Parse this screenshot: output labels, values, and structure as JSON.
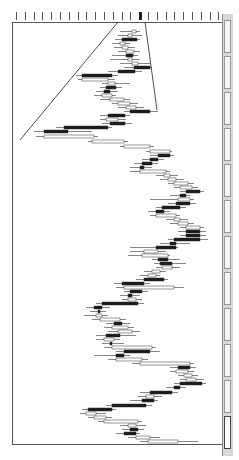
{
  "chart_data": {
    "type": "candlestick",
    "orientation": "rotated-90",
    "title": "",
    "xlabel": "price",
    "ylabel": "time",
    "grid": false,
    "legend": null,
    "price_axis_ticks": 24,
    "highlighted_tick_index": 14,
    "trendlines": [
      {
        "name": "trendline-1",
        "from": [
          118,
          22
        ],
        "to": [
          20,
          140
        ]
      },
      {
        "name": "trendline-2",
        "from": [
          145,
          22
        ],
        "to": [
          157,
          110
        ]
      }
    ],
    "candles_note": "approximate screen positions: y=row, o=open x, c=close x, l=low x, h=high x, bear=filled",
    "candles": [
      {
        "y": 30,
        "o": 132,
        "c": 136,
        "l": 120,
        "h": 140,
        "bear": false
      },
      {
        "y": 34,
        "o": 128,
        "c": 132,
        "l": 118,
        "h": 142,
        "bear": false
      },
      {
        "y": 38,
        "o": 122,
        "c": 137,
        "l": 115,
        "h": 140,
        "bear": true
      },
      {
        "y": 42,
        "o": 120,
        "c": 125,
        "l": 112,
        "h": 130,
        "bear": false
      },
      {
        "y": 46,
        "o": 122,
        "c": 128,
        "l": 114,
        "h": 135,
        "bear": false
      },
      {
        "y": 50,
        "o": 126,
        "c": 134,
        "l": 118,
        "h": 140,
        "bear": false
      },
      {
        "y": 54,
        "o": 126,
        "c": 133,
        "l": 112,
        "h": 138,
        "bear": true
      },
      {
        "y": 58,
        "o": 128,
        "c": 132,
        "l": 110,
        "h": 140,
        "bear": false
      },
      {
        "y": 62,
        "o": 132,
        "c": 138,
        "l": 120,
        "h": 150,
        "bear": false
      },
      {
        "y": 66,
        "o": 134,
        "c": 150,
        "l": 124,
        "h": 152,
        "bear": true
      },
      {
        "y": 70,
        "o": 118,
        "c": 135,
        "l": 108,
        "h": 142,
        "bear": true
      },
      {
        "y": 74,
        "o": 82,
        "c": 112,
        "l": 76,
        "h": 118,
        "bear": true
      },
      {
        "y": 78,
        "o": 82,
        "c": 108,
        "l": 78,
        "h": 115,
        "bear": false
      },
      {
        "y": 82,
        "o": 108,
        "c": 115,
        "l": 102,
        "h": 130,
        "bear": false
      },
      {
        "y": 86,
        "o": 106,
        "c": 116,
        "l": 100,
        "h": 122,
        "bear": true
      },
      {
        "y": 90,
        "o": 104,
        "c": 110,
        "l": 96,
        "h": 118,
        "bear": true
      },
      {
        "y": 94,
        "o": 102,
        "c": 112,
        "l": 94,
        "h": 116,
        "bear": false
      },
      {
        "y": 98,
        "o": 110,
        "c": 124,
        "l": 100,
        "h": 130,
        "bear": false
      },
      {
        "y": 102,
        "o": 118,
        "c": 130,
        "l": 112,
        "h": 138,
        "bear": false
      },
      {
        "y": 106,
        "o": 126,
        "c": 136,
        "l": 118,
        "h": 144,
        "bear": false
      },
      {
        "y": 110,
        "o": 130,
        "c": 150,
        "l": 124,
        "h": 158,
        "bear": true
      },
      {
        "y": 114,
        "o": 108,
        "c": 125,
        "l": 100,
        "h": 130,
        "bear": true
      },
      {
        "y": 118,
        "o": 106,
        "c": 118,
        "l": 100,
        "h": 126,
        "bear": false
      },
      {
        "y": 122,
        "o": 110,
        "c": 125,
        "l": 102,
        "h": 132,
        "bear": true
      },
      {
        "y": 126,
        "o": 64,
        "c": 108,
        "l": 56,
        "h": 112,
        "bear": true
      },
      {
        "y": 130,
        "o": 44,
        "c": 68,
        "l": 34,
        "h": 92,
        "bear": true
      },
      {
        "y": 135,
        "o": 44,
        "c": 94,
        "l": 36,
        "h": 98,
        "bear": false
      },
      {
        "y": 140,
        "o": 92,
        "c": 124,
        "l": 88,
        "h": 128,
        "bear": false
      },
      {
        "y": 145,
        "o": 124,
        "c": 150,
        "l": 120,
        "h": 154,
        "bear": false
      },
      {
        "y": 150,
        "o": 150,
        "c": 170,
        "l": 146,
        "h": 172,
        "bear": false
      },
      {
        "y": 154,
        "o": 158,
        "c": 170,
        "l": 150,
        "h": 174,
        "bear": true
      },
      {
        "y": 158,
        "o": 150,
        "c": 158,
        "l": 142,
        "h": 164,
        "bear": true
      },
      {
        "y": 162,
        "o": 142,
        "c": 152,
        "l": 134,
        "h": 158,
        "bear": true
      },
      {
        "y": 166,
        "o": 140,
        "c": 144,
        "l": 130,
        "h": 152,
        "bear": true
      },
      {
        "y": 170,
        "o": 140,
        "c": 166,
        "l": 130,
        "h": 170,
        "bear": false
      },
      {
        "y": 174,
        "o": 164,
        "c": 170,
        "l": 156,
        "h": 178,
        "bear": false
      },
      {
        "y": 178,
        "o": 168,
        "c": 176,
        "l": 160,
        "h": 184,
        "bear": false
      },
      {
        "y": 182,
        "o": 174,
        "c": 188,
        "l": 168,
        "h": 194,
        "bear": false
      },
      {
        "y": 186,
        "o": 180,
        "c": 192,
        "l": 174,
        "h": 198,
        "bear": false
      },
      {
        "y": 190,
        "o": 186,
        "c": 200,
        "l": 180,
        "h": 204,
        "bear": true
      },
      {
        "y": 194,
        "o": 180,
        "c": 186,
        "l": 170,
        "h": 190,
        "bear": true
      },
      {
        "y": 198,
        "o": 178,
        "c": 190,
        "l": 150,
        "h": 194,
        "bear": false
      },
      {
        "y": 202,
        "o": 176,
        "c": 190,
        "l": 168,
        "h": 196,
        "bear": true
      },
      {
        "y": 206,
        "o": 162,
        "c": 180,
        "l": 156,
        "h": 186,
        "bear": true
      },
      {
        "y": 210,
        "o": 156,
        "c": 164,
        "l": 148,
        "h": 170,
        "bear": true
      },
      {
        "y": 214,
        "o": 156,
        "c": 176,
        "l": 150,
        "h": 180,
        "bear": false
      },
      {
        "y": 218,
        "o": 174,
        "c": 180,
        "l": 166,
        "h": 188,
        "bear": false
      },
      {
        "y": 222,
        "o": 178,
        "c": 188,
        "l": 170,
        "h": 194,
        "bear": false
      },
      {
        "y": 226,
        "o": 186,
        "c": 200,
        "l": 180,
        "h": 204,
        "bear": false
      },
      {
        "y": 230,
        "o": 186,
        "c": 200,
        "l": 178,
        "h": 206,
        "bear": true
      },
      {
        "y": 234,
        "o": 186,
        "c": 200,
        "l": 180,
        "h": 206,
        "bear": true
      },
      {
        "y": 238,
        "o": 174,
        "c": 200,
        "l": 168,
        "h": 208,
        "bear": true
      },
      {
        "y": 242,
        "o": 170,
        "c": 176,
        "l": 160,
        "h": 190,
        "bear": true
      },
      {
        "y": 246,
        "o": 156,
        "c": 176,
        "l": 130,
        "h": 178,
        "bear": true
      },
      {
        "y": 250,
        "o": 144,
        "c": 158,
        "l": 130,
        "h": 166,
        "bear": false
      },
      {
        "y": 254,
        "o": 142,
        "c": 168,
        "l": 128,
        "h": 170,
        "bear": false
      },
      {
        "y": 258,
        "o": 158,
        "c": 168,
        "l": 152,
        "h": 180,
        "bear": true
      },
      {
        "y": 262,
        "o": 160,
        "c": 172,
        "l": 154,
        "h": 186,
        "bear": true
      },
      {
        "y": 266,
        "o": 162,
        "c": 172,
        "l": 156,
        "h": 180,
        "bear": false
      },
      {
        "y": 270,
        "o": 152,
        "c": 160,
        "l": 144,
        "h": 166,
        "bear": false
      },
      {
        "y": 274,
        "o": 148,
        "c": 156,
        "l": 140,
        "h": 160,
        "bear": false
      },
      {
        "y": 278,
        "o": 144,
        "c": 164,
        "l": 136,
        "h": 168,
        "bear": true
      },
      {
        "y": 282,
        "o": 122,
        "c": 144,
        "l": 114,
        "h": 150,
        "bear": true
      },
      {
        "y": 286,
        "o": 124,
        "c": 174,
        "l": 116,
        "h": 184,
        "bear": false
      },
      {
        "y": 290,
        "o": 130,
        "c": 142,
        "l": 124,
        "h": 148,
        "bear": true
      },
      {
        "y": 294,
        "o": 128,
        "c": 132,
        "l": 120,
        "h": 140,
        "bear": true
      },
      {
        "y": 298,
        "o": 128,
        "c": 136,
        "l": 122,
        "h": 142,
        "bear": false
      },
      {
        "y": 302,
        "o": 102,
        "c": 138,
        "l": 96,
        "h": 144,
        "bear": true
      },
      {
        "y": 306,
        "o": 94,
        "c": 102,
        "l": 86,
        "h": 110,
        "bear": true
      },
      {
        "y": 310,
        "o": 98,
        "c": 100,
        "l": 90,
        "h": 106,
        "bear": true
      },
      {
        "y": 314,
        "o": 96,
        "c": 102,
        "l": 84,
        "h": 108,
        "bear": false
      },
      {
        "y": 318,
        "o": 100,
        "c": 120,
        "l": 92,
        "h": 126,
        "bear": false
      },
      {
        "y": 322,
        "o": 114,
        "c": 122,
        "l": 106,
        "h": 130,
        "bear": true
      },
      {
        "y": 326,
        "o": 112,
        "c": 128,
        "l": 104,
        "h": 134,
        "bear": false
      },
      {
        "y": 330,
        "o": 118,
        "c": 132,
        "l": 108,
        "h": 140,
        "bear": false
      },
      {
        "y": 334,
        "o": 106,
        "c": 120,
        "l": 96,
        "h": 136,
        "bear": true
      },
      {
        "y": 338,
        "o": 104,
        "c": 114,
        "l": 96,
        "h": 120,
        "bear": false
      },
      {
        "y": 342,
        "o": 110,
        "c": 112,
        "l": 102,
        "h": 124,
        "bear": true
      },
      {
        "y": 346,
        "o": 112,
        "c": 152,
        "l": 104,
        "h": 156,
        "bear": false
      },
      {
        "y": 350,
        "o": 124,
        "c": 150,
        "l": 116,
        "h": 160,
        "bear": true
      },
      {
        "y": 354,
        "o": 116,
        "c": 124,
        "l": 94,
        "h": 130,
        "bear": true
      },
      {
        "y": 358,
        "o": 116,
        "c": 142,
        "l": 108,
        "h": 148,
        "bear": false
      },
      {
        "y": 362,
        "o": 140,
        "c": 190,
        "l": 132,
        "h": 194,
        "bear": false
      },
      {
        "y": 366,
        "o": 178,
        "c": 190,
        "l": 170,
        "h": 196,
        "bear": true
      },
      {
        "y": 370,
        "o": 176,
        "c": 188,
        "l": 170,
        "h": 194,
        "bear": false
      },
      {
        "y": 374,
        "o": 184,
        "c": 192,
        "l": 178,
        "h": 198,
        "bear": false
      },
      {
        "y": 378,
        "o": 186,
        "c": 196,
        "l": 180,
        "h": 204,
        "bear": false
      },
      {
        "y": 382,
        "o": 180,
        "c": 202,
        "l": 174,
        "h": 206,
        "bear": true
      },
      {
        "y": 386,
        "o": 174,
        "c": 180,
        "l": 166,
        "h": 186,
        "bear": true
      },
      {
        "y": 391,
        "o": 150,
        "c": 172,
        "l": 140,
        "h": 178,
        "bear": true
      },
      {
        "y": 395,
        "o": 146,
        "c": 154,
        "l": 138,
        "h": 162,
        "bear": false
      },
      {
        "y": 399,
        "o": 142,
        "c": 154,
        "l": 130,
        "h": 158,
        "bear": true
      },
      {
        "y": 404,
        "o": 112,
        "c": 146,
        "l": 106,
        "h": 152,
        "bear": true
      },
      {
        "y": 408,
        "o": 88,
        "c": 112,
        "l": 82,
        "h": 116,
        "bear": true
      },
      {
        "y": 412,
        "o": 86,
        "c": 96,
        "l": 80,
        "h": 106,
        "bear": false
      },
      {
        "y": 416,
        "o": 94,
        "c": 106,
        "l": 88,
        "h": 112,
        "bear": false
      },
      {
        "y": 420,
        "o": 104,
        "c": 138,
        "l": 98,
        "h": 142,
        "bear": false
      },
      {
        "y": 424,
        "o": 128,
        "c": 136,
        "l": 120,
        "h": 146,
        "bear": false
      },
      {
        "y": 428,
        "o": 130,
        "c": 138,
        "l": 122,
        "h": 144,
        "bear": true
      },
      {
        "y": 432,
        "o": 124,
        "c": 136,
        "l": 116,
        "h": 140,
        "bear": true
      },
      {
        "y": 436,
        "o": 136,
        "c": 150,
        "l": 128,
        "h": 160,
        "bear": false
      },
      {
        "y": 440,
        "o": 148,
        "c": 178,
        "l": 140,
        "h": 198,
        "bear": false
      }
    ]
  },
  "axis_label": "",
  "sheet_tabs": {
    "count": 12,
    "active_index": 11
  }
}
